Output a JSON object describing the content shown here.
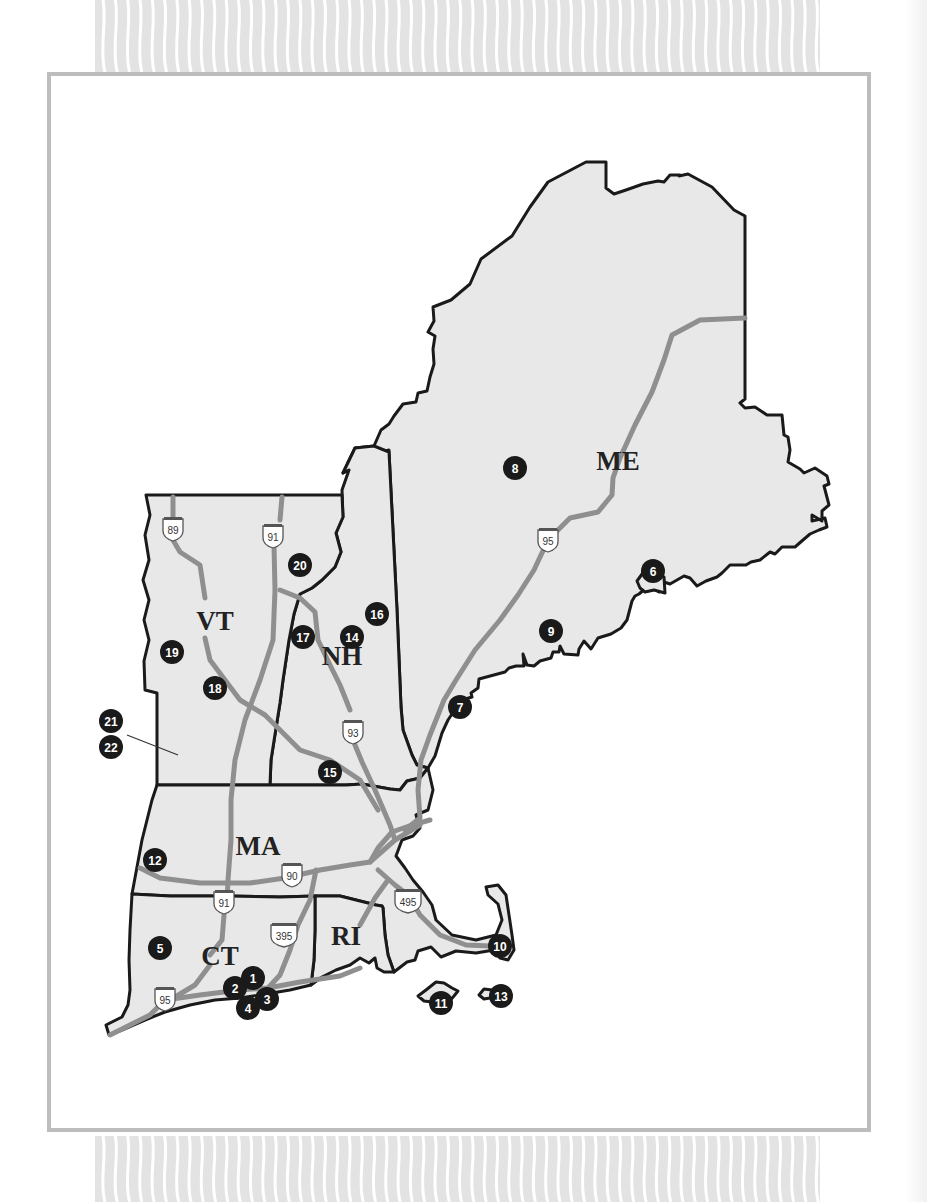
{
  "map": {
    "region": "New England",
    "states": [
      {
        "code": "ME",
        "label": "ME",
        "x": 618,
        "y": 470
      },
      {
        "code": "NH",
        "label": "NH",
        "x": 342,
        "y": 665
      },
      {
        "code": "VT",
        "label": "VT",
        "x": 215,
        "y": 630
      },
      {
        "code": "MA",
        "label": "MA",
        "x": 258,
        "y": 855
      },
      {
        "code": "CT",
        "label": "CT",
        "x": 220,
        "y": 965
      },
      {
        "code": "RI",
        "label": "RI",
        "x": 346,
        "y": 945
      }
    ],
    "markers": [
      {
        "id": 1,
        "label": "1",
        "x": 253,
        "y": 978
      },
      {
        "id": 2,
        "label": "2",
        "x": 235,
        "y": 988
      },
      {
        "id": 3,
        "label": "3",
        "x": 267,
        "y": 999
      },
      {
        "id": 4,
        "label": "4",
        "x": 248,
        "y": 1008
      },
      {
        "id": 5,
        "label": "5",
        "x": 160,
        "y": 948
      },
      {
        "id": 6,
        "label": "6",
        "x": 653,
        "y": 571
      },
      {
        "id": 7,
        "label": "7",
        "x": 460,
        "y": 707
      },
      {
        "id": 8,
        "label": "8",
        "x": 515,
        "y": 468
      },
      {
        "id": 9,
        "label": "9",
        "x": 551,
        "y": 631
      },
      {
        "id": 10,
        "label": "10",
        "x": 500,
        "y": 946
      },
      {
        "id": 11,
        "label": "11",
        "x": 441,
        "y": 1003
      },
      {
        "id": 12,
        "label": "12",
        "x": 155,
        "y": 860
      },
      {
        "id": 13,
        "label": "13",
        "x": 501,
        "y": 996
      },
      {
        "id": 14,
        "label": "14",
        "x": 352,
        "y": 637
      },
      {
        "id": 15,
        "label": "15",
        "x": 330,
        "y": 772
      },
      {
        "id": 16,
        "label": "16",
        "x": 377,
        "y": 614
      },
      {
        "id": 17,
        "label": "17",
        "x": 303,
        "y": 637
      },
      {
        "id": 18,
        "label": "18",
        "x": 215,
        "y": 688
      },
      {
        "id": 19,
        "label": "19",
        "x": 172,
        "y": 652
      },
      {
        "id": 20,
        "label": "20",
        "x": 300,
        "y": 565
      },
      {
        "id": 21,
        "label": "21",
        "x": 111,
        "y": 721
      },
      {
        "id": 22,
        "label": "22",
        "x": 111,
        "y": 747
      }
    ],
    "highway_shields": [
      {
        "route": "89",
        "x": 173,
        "y": 529
      },
      {
        "route": "91",
        "x": 273,
        "y": 536
      },
      {
        "route": "93",
        "x": 353,
        "y": 732
      },
      {
        "route": "95",
        "x": 548,
        "y": 540
      },
      {
        "route": "90",
        "x": 292,
        "y": 875
      },
      {
        "route": "91",
        "x": 224,
        "y": 902
      },
      {
        "route": "395",
        "x": 284,
        "y": 935
      },
      {
        "route": "495",
        "x": 408,
        "y": 901
      },
      {
        "route": "95",
        "x": 165,
        "y": 999
      }
    ],
    "colors": {
      "land": "#e8e8e8",
      "border": "#1a1a1a",
      "highway": "#8f8f8f",
      "marker": "#1a1a1a",
      "frame": "#bdbdbd",
      "stripes": "#e3e3e3"
    }
  }
}
